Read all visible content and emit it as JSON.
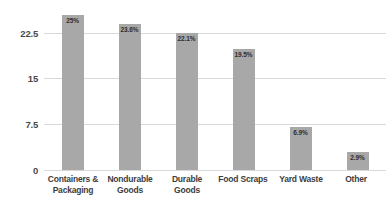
{
  "chart_data": {
    "type": "bar",
    "title": "",
    "subtitle": "",
    "xlabel": "",
    "ylabel": "",
    "ylim": [
      0,
      25.8
    ],
    "yticks": [
      0,
      7.5,
      15,
      22.5
    ],
    "ytick_labels": [
      "0",
      "7.5",
      "15",
      "22.5"
    ],
    "grid": "horizontal",
    "legend": "none",
    "bar_color": "#a8a8a8",
    "gridline_color": "#d9d9d9",
    "background_color": "#ffffff",
    "label_color": "#2e2e2e",
    "categories": [
      "Containers & Packaging",
      "Nondurable Goods",
      "Durable Goods",
      "Food Scraps",
      "Yard Waste",
      "Other"
    ],
    "category_lines": [
      [
        "Containers &",
        "Packaging"
      ],
      [
        "Nondurable",
        "Goods"
      ],
      [
        "Durable",
        "Goods"
      ],
      [
        "Food Scraps"
      ],
      [
        "Yard Waste"
      ],
      [
        "Other"
      ]
    ],
    "values": [
      25,
      23.6,
      22.1,
      19.5,
      6.9,
      2.9
    ],
    "value_labels": [
      "25%",
      "23.6%",
      "22.1%",
      "19.5%",
      "6.9%",
      "2.9%"
    ]
  }
}
